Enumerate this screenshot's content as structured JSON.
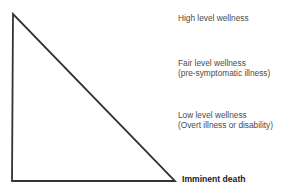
{
  "diagram": {
    "type": "wellness-illness-continuum-triangle",
    "line_color": "#333333",
    "labels": [
      {
        "line1": "High level wellness",
        "line2": ""
      },
      {
        "line1": "Fair level wellness",
        "line2": "(pre-symptomatic illness)"
      },
      {
        "line1": "Low level wellness",
        "line2": "(Overt illness or disability)"
      }
    ],
    "bottom_label": "Imminent death"
  }
}
